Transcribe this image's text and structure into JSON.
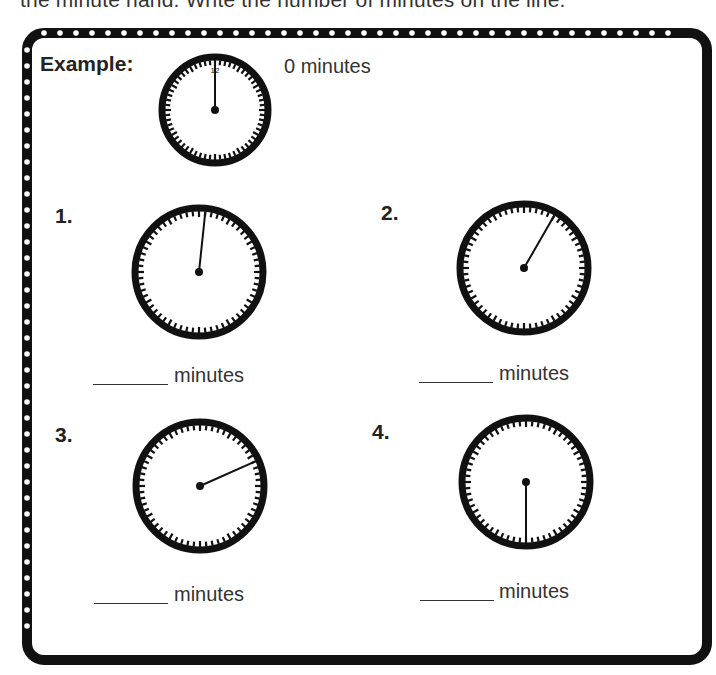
{
  "instruction": "the minute hand. Write the number of minutes on the line.",
  "example": {
    "label": "Example:",
    "minutes": 0,
    "answer_text": "0 minutes",
    "twelve_label": "12"
  },
  "problems": [
    {
      "number_label": "1.",
      "minutes": 1,
      "unit": "minutes"
    },
    {
      "number_label": "2.",
      "minutes": 5,
      "unit": "minutes"
    },
    {
      "number_label": "3.",
      "minutes": 11,
      "unit": "minutes"
    },
    {
      "number_label": "4.",
      "minutes": 30,
      "unit": "minutes"
    }
  ],
  "colors": {
    "ink": "#111111",
    "text": "#333333",
    "paper": "#ffffff"
  }
}
